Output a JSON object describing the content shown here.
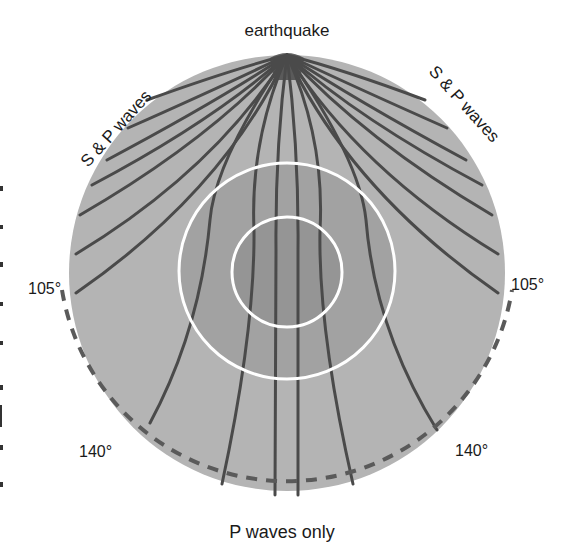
{
  "diagram": {
    "labels": {
      "source": "earthquake",
      "left_arc": "S & P waves",
      "right_arc": "S & P waves",
      "angle_left_105": "105°",
      "angle_right_105": "105°",
      "angle_left_140": "140°",
      "angle_right_140": "140°",
      "bottom": "P waves only"
    },
    "colors": {
      "mantle": "#b4b4b4",
      "outer_core": "#a2a2a2",
      "inner_core": "#959595",
      "core_boundary": "#ffffff",
      "ray": "#4a4a4a",
      "dashed_arc": "#5a5a5a",
      "text": "#1a1a1a"
    },
    "geometry": {
      "center": [
        287,
        273
      ],
      "earth_radius": 218,
      "outer_core_radius": 108,
      "inner_core_radius": 55,
      "source_point": [
        287,
        55
      ],
      "dashed_arc_radius": 234
    }
  }
}
